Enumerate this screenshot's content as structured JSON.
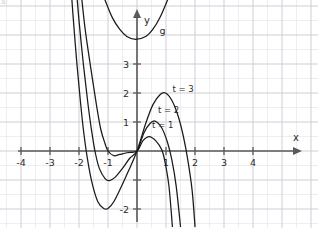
{
  "figure": {
    "corner_mark": "a)",
    "background_color": "#ffffff",
    "grid_minor_color": "#e6e6ec",
    "grid_major_color": "#c9c9d2",
    "axis_color": "#5a5a5a",
    "curve_color": "#1a1a1a"
  },
  "axes": {
    "x_axis_name": "x",
    "y_axis_name": "y",
    "x_ticks": [
      {
        "value": -4,
        "label": "-4"
      },
      {
        "value": -3,
        "label": "-3"
      },
      {
        "value": -2,
        "label": "-2"
      },
      {
        "value": -1,
        "label": "-1"
      },
      {
        "value": 1,
        "label": "1"
      },
      {
        "value": 2,
        "label": "2"
      },
      {
        "value": 3,
        "label": "3"
      },
      {
        "value": 4,
        "label": "4"
      }
    ],
    "y_ticks": [
      {
        "value": 3,
        "label": "3"
      },
      {
        "value": 2,
        "label": "2"
      },
      {
        "value": 1,
        "label": "1"
      },
      {
        "value": -2,
        "label": "-2"
      }
    ],
    "y_ticks_unlabeled": [
      -1
    ],
    "xlim": [
      -4.75,
      6.25
    ],
    "ylim": [
      -2.65,
      5.65
    ]
  },
  "chart_data": {
    "type": "line",
    "title": "",
    "xlabel": "x",
    "ylabel": "y",
    "xlim": [
      -4.75,
      6.25
    ],
    "ylim": [
      -2.65,
      5.65
    ],
    "grid": true,
    "legend": "inline-labels",
    "series": [
      {
        "name": "t = 1",
        "label": "t = 1",
        "label_position": {
          "x": 0.52,
          "y": 0.78
        },
        "local_min": {
          "x": -0.8,
          "y": -0.15
        },
        "local_max": {
          "x": 0.42,
          "y": 0.5
        },
        "roots": [
          -1.25,
          0,
          0.92
        ],
        "points": [
          {
            "x": -1.95,
            "y": 5.7
          },
          {
            "x": -1.8,
            "y": 4.3
          },
          {
            "x": -1.6,
            "y": 2.9
          },
          {
            "x": -1.4,
            "y": 1.6
          },
          {
            "x": -1.25,
            "y": 0.75
          },
          {
            "x": -1.1,
            "y": 0.25
          },
          {
            "x": -1.0,
            "y": 0.0
          },
          {
            "x": -0.8,
            "y": -0.16
          },
          {
            "x": -0.6,
            "y": -0.12
          },
          {
            "x": -0.35,
            "y": -0.06
          },
          {
            "x": 0.0,
            "y": 0.0
          },
          {
            "x": 0.2,
            "y": 0.35
          },
          {
            "x": 0.42,
            "y": 0.5
          },
          {
            "x": 0.65,
            "y": 0.35
          },
          {
            "x": 0.85,
            "y": 0.05
          },
          {
            "x": 0.95,
            "y": -0.3
          },
          {
            "x": 1.1,
            "y": -1.2
          },
          {
            "x": 1.22,
            "y": -2.6
          }
        ]
      },
      {
        "name": "t = 2",
        "label": "t = 2",
        "label_position": {
          "x": 0.72,
          "y": 1.32
        },
        "local_min": {
          "x": -0.95,
          "y": -1.0
        },
        "local_max": {
          "x": 0.62,
          "y": 1.02
        },
        "roots": [
          -1.6,
          0,
          1.3
        ],
        "points": [
          {
            "x": -2.1,
            "y": 5.7
          },
          {
            "x": -2.0,
            "y": 4.5
          },
          {
            "x": -1.85,
            "y": 3.0
          },
          {
            "x": -1.7,
            "y": 1.7
          },
          {
            "x": -1.58,
            "y": 0.8
          },
          {
            "x": -1.45,
            "y": 0.0
          },
          {
            "x": -1.3,
            "y": -0.6
          },
          {
            "x": -1.1,
            "y": -0.95
          },
          {
            "x": -0.95,
            "y": -1.02
          },
          {
            "x": -0.75,
            "y": -0.9
          },
          {
            "x": -0.5,
            "y": -0.6
          },
          {
            "x": -0.25,
            "y": -0.25
          },
          {
            "x": 0.0,
            "y": 0.0
          },
          {
            "x": 0.25,
            "y": 0.65
          },
          {
            "x": 0.45,
            "y": 0.95
          },
          {
            "x": 0.62,
            "y": 1.03
          },
          {
            "x": 0.85,
            "y": 0.8
          },
          {
            "x": 1.05,
            "y": 0.3
          },
          {
            "x": 1.2,
            "y": -0.3
          },
          {
            "x": 1.35,
            "y": -1.2
          },
          {
            "x": 1.5,
            "y": -2.6
          }
        ]
      },
      {
        "name": "t = 3",
        "label": "t = 3",
        "label_position": {
          "x": 1.22,
          "y": 2.02
        },
        "local_min": {
          "x": -1.05,
          "y": -2.0
        },
        "local_max": {
          "x": 0.95,
          "y": 2.0
        },
        "roots": [
          -1.85,
          0,
          1.78
        ],
        "points": [
          {
            "x": -2.28,
            "y": 5.7
          },
          {
            "x": -2.2,
            "y": 4.6
          },
          {
            "x": -2.08,
            "y": 3.1
          },
          {
            "x": -1.95,
            "y": 1.7
          },
          {
            "x": -1.85,
            "y": 0.75
          },
          {
            "x": -1.72,
            "y": -0.2
          },
          {
            "x": -1.55,
            "y": -1.1
          },
          {
            "x": -1.35,
            "y": -1.75
          },
          {
            "x": -1.15,
            "y": -1.98
          },
          {
            "x": -1.0,
            "y": -1.98
          },
          {
            "x": -0.8,
            "y": -1.75
          },
          {
            "x": -0.55,
            "y": -1.25
          },
          {
            "x": -0.3,
            "y": -0.7
          },
          {
            "x": 0.0,
            "y": 0.0
          },
          {
            "x": 0.3,
            "y": 0.95
          },
          {
            "x": 0.55,
            "y": 1.6
          },
          {
            "x": 0.8,
            "y": 1.95
          },
          {
            "x": 0.98,
            "y": 2.0
          },
          {
            "x": 1.2,
            "y": 1.75
          },
          {
            "x": 1.42,
            "y": 1.2
          },
          {
            "x": 1.6,
            "y": 0.5
          },
          {
            "x": 1.75,
            "y": -0.3
          },
          {
            "x": 1.9,
            "y": -1.35
          },
          {
            "x": 2.0,
            "y": -2.6
          }
        ]
      },
      {
        "name": "g",
        "label": "g",
        "label_position": {
          "x": 0.78,
          "y": 4.05
        },
        "vertex": {
          "x": -0.05,
          "y": 3.85
        },
        "points": [
          {
            "x": -1.3,
            "y": 5.7
          },
          {
            "x": -1.1,
            "y": 5.2
          },
          {
            "x": -0.85,
            "y": 4.6
          },
          {
            "x": -0.6,
            "y": 4.2
          },
          {
            "x": -0.35,
            "y": 3.95
          },
          {
            "x": -0.05,
            "y": 3.85
          },
          {
            "x": 0.3,
            "y": 3.95
          },
          {
            "x": 0.55,
            "y": 4.2
          },
          {
            "x": 0.8,
            "y": 4.62
          },
          {
            "x": 1.05,
            "y": 5.2
          },
          {
            "x": 1.25,
            "y": 5.7
          }
        ]
      }
    ]
  }
}
